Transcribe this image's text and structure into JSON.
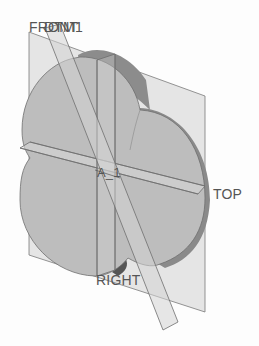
{
  "viewport": {
    "background": "#fdfdfd",
    "model_fill": "#bdbdbd",
    "model_side_fill": "#8f8f8f",
    "plane_fill": "#d9d9d9",
    "edge_color": "#6e6e6e",
    "label_color": "#555555"
  },
  "datums": {
    "front": {
      "label": "FRONT"
    },
    "dtm1": {
      "label": "DTM1"
    },
    "top": {
      "label": "TOP"
    },
    "right": {
      "label": "RIGHT"
    },
    "axis": {
      "label": "A_1"
    }
  }
}
